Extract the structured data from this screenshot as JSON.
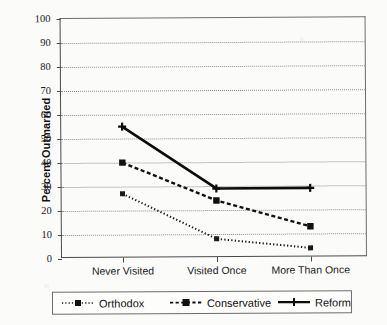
{
  "chart_data": {
    "type": "line",
    "title": "",
    "xlabel": "",
    "ylabel": "Percent Outmarried",
    "categories": [
      "Never Visited",
      "Visited Once",
      "More Than Once"
    ],
    "ylim": [
      0,
      100
    ],
    "yticks": [
      0,
      10,
      20,
      30,
      40,
      50,
      60,
      70,
      80,
      90,
      100
    ],
    "grid": true,
    "legend_position": "bottom",
    "series": [
      {
        "name": "Orthodox",
        "values": [
          27,
          8,
          4
        ],
        "style": "dotted",
        "marker": "square",
        "color": "#1a1a1a"
      },
      {
        "name": "Conservative",
        "values": [
          40,
          24,
          13
        ],
        "style": "dashed",
        "marker": "square",
        "color": "#111111"
      },
      {
        "name": "Reform",
        "values": [
          55,
          29,
          29
        ],
        "style": "solid",
        "marker": "plus",
        "color": "#0c0c0c"
      }
    ]
  },
  "axis": {
    "y_title": "Percent Outmarried",
    "y_labels": [
      "100",
      "90",
      "80",
      "70",
      "60",
      "50",
      "40",
      "30",
      "20",
      "10",
      "0"
    ],
    "x_labels": [
      "Never Visited",
      "Visited Once",
      "More Than Once"
    ]
  },
  "legend": {
    "items": [
      {
        "label": "Orthodox",
        "swatch": "dotted-square-line-icon"
      },
      {
        "label": "Conservative",
        "swatch": "dashed-square-line-icon"
      },
      {
        "label": "Reform",
        "swatch": "solid-plus-line-icon"
      }
    ]
  }
}
